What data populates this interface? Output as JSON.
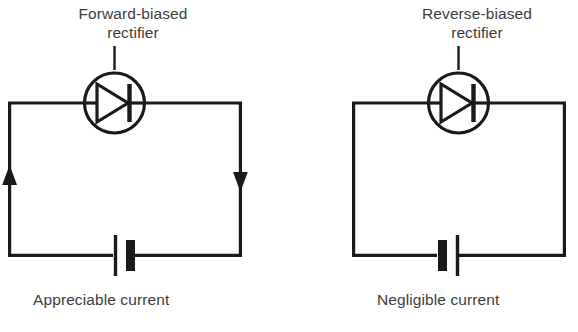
{
  "figure": {
    "background_color": "#ffffff",
    "ink_color": "#1a1a1a",
    "text_color": "#3d3d3d",
    "width": 578,
    "height": 332
  },
  "panels": [
    {
      "id": "forward-biased",
      "title": "Forward-biased\nrectifier",
      "caption": "Appreciable current",
      "component_label": "rectifier-diode",
      "diode_symbol": "triangle-right-with-bar",
      "battery_orientation": "positive-left",
      "current_arrows": [
        {
          "side": "left",
          "direction": "up"
        },
        {
          "side": "right",
          "direction": "down"
        }
      ],
      "current_state": "appreciable"
    },
    {
      "id": "reverse-biased",
      "title": "Reverse-biased\nrectifier",
      "caption": "Negligible current",
      "component_label": "rectifier-diode",
      "diode_symbol": "triangle-right-with-bar",
      "battery_orientation": "positive-right",
      "current_arrows": [],
      "current_state": "negligible"
    }
  ],
  "footnote": ""
}
